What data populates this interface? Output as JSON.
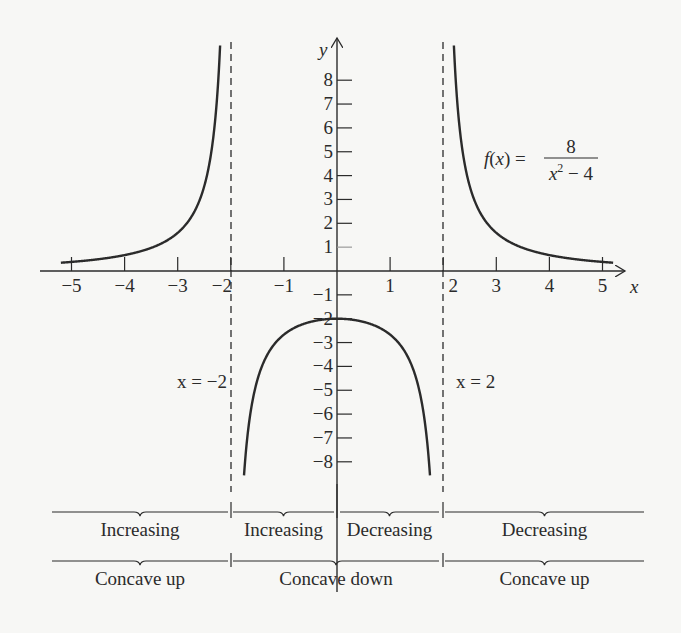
{
  "chart_data": {
    "type": "line",
    "title": "",
    "function_label": {
      "lhs": "f(x) =",
      "numerator": "8",
      "denominator": "x² − 4"
    },
    "xlabel": "x",
    "ylabel": "y",
    "xlim": [
      -5.3,
      5.5
    ],
    "ylim": [
      -8.6,
      9.4
    ],
    "grid": false,
    "x_ticks": [
      -5,
      -4,
      -3,
      -2,
      -1,
      1,
      2,
      3,
      4,
      5
    ],
    "x_tick_labels": [
      "−5",
      "−4",
      "−3",
      "−2",
      "−1",
      "1",
      "2",
      "3",
      "4",
      "5"
    ],
    "y_ticks": [
      8,
      7,
      6,
      5,
      4,
      3,
      2,
      1,
      -1,
      -2,
      -3,
      -4,
      -5,
      -6,
      -7,
      -8
    ],
    "y_tick_labels": [
      "8",
      "7",
      "6",
      "5",
      "4",
      "3",
      "2",
      "1",
      "−1",
      "−2",
      "−3",
      "−4",
      "−5",
      "−6",
      "−7",
      "−8"
    ],
    "asymptotes": [
      {
        "x": -2,
        "label": "x = −2"
      },
      {
        "x": 2,
        "label": "x = 2"
      }
    ],
    "series": [
      {
        "name": "left branch",
        "x": [
          -5.2,
          -5,
          -4,
          -3,
          -2.5,
          -2.3,
          -2.2,
          -2.15
        ],
        "y": [
          0.35,
          0.38,
          0.67,
          1.6,
          3.56,
          6.2,
          9.5,
          12.4
        ]
      },
      {
        "name": "middle branch",
        "x": [
          -1.9,
          -1.8,
          -1.5,
          -1,
          -0.5,
          0,
          0.5,
          1,
          1.5,
          1.8,
          1.9
        ],
        "y": [
          -20.5,
          -10.5,
          -4.57,
          -2.67,
          -2.13,
          -2,
          -2.13,
          -2.67,
          -4.57,
          -10.5,
          -20.5
        ]
      },
      {
        "name": "right branch",
        "x": [
          2.15,
          2.2,
          2.3,
          2.5,
          3,
          4,
          5,
          5.2
        ],
        "y": [
          12.4,
          9.5,
          6.2,
          3.56,
          1.6,
          0.67,
          0.38,
          0.35
        ]
      }
    ],
    "intervals": {
      "monotonicity": [
        {
          "range": "(−∞, −2)",
          "label": "Increasing"
        },
        {
          "range": "(−2, 0)",
          "label": "Increasing"
        },
        {
          "range": "(0, 2)",
          "label": "Decreasing"
        },
        {
          "range": "(2, ∞)",
          "label": "Decreasing"
        }
      ],
      "concavity": [
        {
          "range": "(−∞, −2)",
          "label": "Concave up"
        },
        {
          "range": "(−2, 2)",
          "label": "Concave down"
        },
        {
          "range": "(2, ∞)",
          "label": "Concave up"
        }
      ]
    }
  },
  "colors": {
    "ink": "#2b2b2b",
    "background": "#f7f7f5"
  }
}
